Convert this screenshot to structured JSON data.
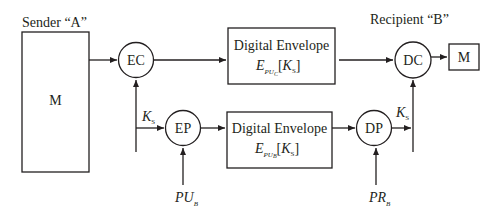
{
  "sender": {
    "label": "Sender “A”",
    "message": "M"
  },
  "recipient": {
    "label": "Recipient “B”",
    "message": "M"
  },
  "nodes": {
    "ec": "EC",
    "ep": "EP",
    "dc": "DC",
    "dp": "DP"
  },
  "envelopes": {
    "top": {
      "title": "Digital Envelope",
      "expr_main": "E",
      "expr_sub": "PU",
      "expr_subsub": "C",
      "expr_arg_open": "[",
      "expr_arg": "K",
      "expr_arg_sub": "S",
      "expr_arg_close": "]"
    },
    "bottom": {
      "title": "Digital Envelope",
      "expr_main": "E",
      "expr_sub": "PU",
      "expr_subsub": "B",
      "expr_arg_open": "[",
      "expr_arg": "K",
      "expr_arg_sub": "S",
      "expr_arg_close": "]"
    }
  },
  "keys": {
    "ks_sender": {
      "main": "K",
      "sub": "S"
    },
    "ks_recipient": {
      "main": "K",
      "sub": "S"
    },
    "pub": {
      "main": "PU",
      "sub": "B"
    },
    "prb": {
      "main": "PR",
      "sub": "B"
    }
  },
  "colors": {
    "stroke": "#231f20",
    "background": "#ffffff"
  }
}
